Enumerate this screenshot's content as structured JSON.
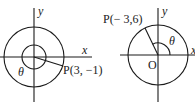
{
  "figures": [
    {
      "id": "left",
      "point_label": "P(3, −1)",
      "angle_label": "θ",
      "x_axis_label": "x",
      "y_axis_label": "y"
    },
    {
      "id": "right",
      "point_label": "P(− 3,6)",
      "angle_label": "θ",
      "origin_label": "O",
      "x_axis_label": "x",
      "y_axis_label": "y"
    }
  ],
  "colors": {
    "stroke": "#1a1a1a",
    "background": "#ffffff"
  }
}
